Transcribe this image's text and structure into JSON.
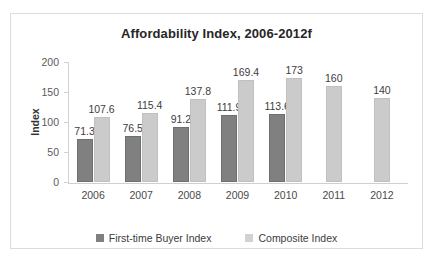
{
  "chart_data": {
    "type": "bar",
    "title": "Affordability Index, 2006-2012f",
    "xlabel": "",
    "ylabel": "Index",
    "ylim": [
      0,
      200
    ],
    "yticks": [
      0,
      50,
      100,
      150,
      200
    ],
    "grid": false,
    "legend_position": "bottom",
    "categories": [
      "2006",
      "2007",
      "2008",
      "2009",
      "2010",
      "2011",
      "2012"
    ],
    "series": [
      {
        "name": "First-time Buyer Index",
        "color": "#808080",
        "values": [
          71.3,
          76.5,
          91.2,
          111.9,
          113.6,
          null,
          null
        ],
        "labels": [
          "71.3",
          "76.5",
          "91.2",
          "111.9",
          "113.6",
          "",
          ""
        ]
      },
      {
        "name": "Composite Index",
        "color": "#cbcbcb",
        "values": [
          107.6,
          115.4,
          137.8,
          169.4,
          173,
          160,
          140
        ],
        "labels": [
          "107.6",
          "115.4",
          "137.8",
          "169.4",
          "173",
          "160",
          "140"
        ]
      }
    ]
  }
}
